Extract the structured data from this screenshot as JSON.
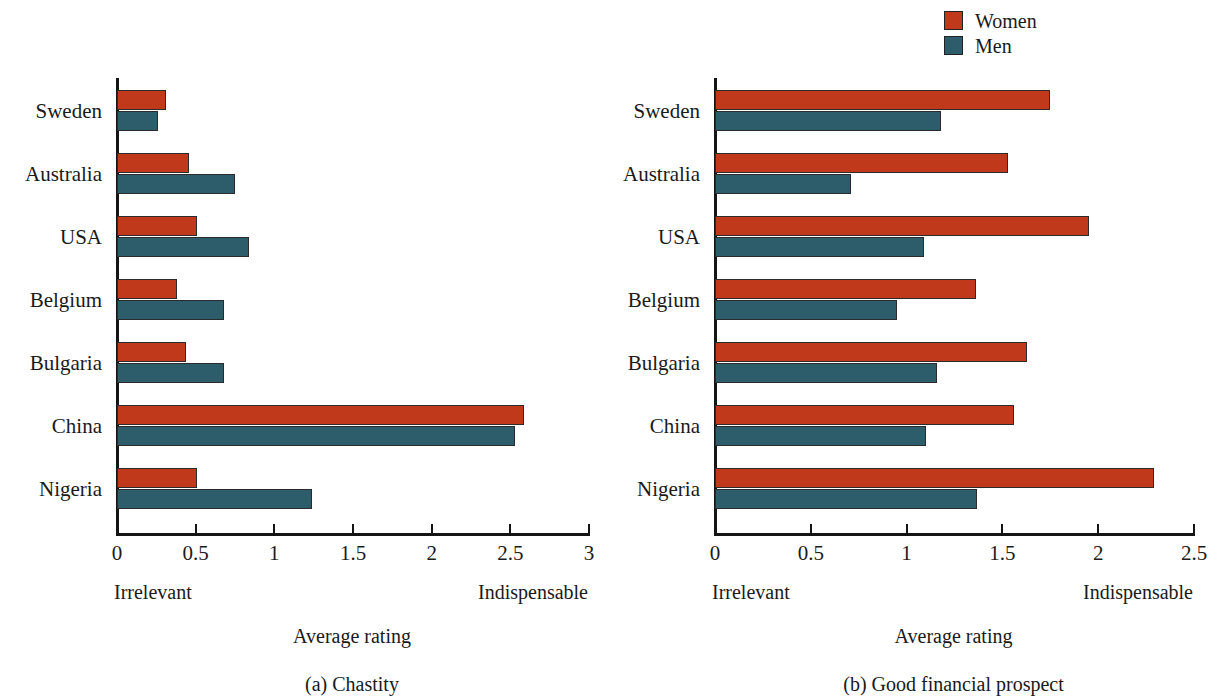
{
  "legend": {
    "items": [
      {
        "label": "Women",
        "color": "#c0391a",
        "icon": "legend-swatch-icon"
      },
      {
        "label": "Men",
        "color": "#2d5c6b",
        "icon": "legend-swatch-icon"
      }
    ]
  },
  "chart_data": [
    {
      "type": "bar",
      "orientation": "horizontal",
      "title": "(a) Chastity",
      "xlabel": "Average rating",
      "ylabel": "",
      "xlim": [
        0,
        3
      ],
      "xticks": [
        "0",
        "0.5",
        "1",
        "1.5",
        "2",
        "2.5",
        "3"
      ],
      "xtick_values": [
        0,
        0.5,
        1,
        1.5,
        2,
        2.5,
        3
      ],
      "grid": false,
      "legend_position": "top-right",
      "scale_low_label": "Irrelevant",
      "scale_high_label": "Indispensable",
      "categories": [
        "Sweden",
        "Australia",
        "USA",
        "Belgium",
        "Bulgaria",
        "China",
        "Nigeria"
      ],
      "series": [
        {
          "name": "Women",
          "color": "#c0391a",
          "values": [
            0.31,
            0.46,
            0.51,
            0.38,
            0.44,
            2.59,
            0.51
          ]
        },
        {
          "name": "Men",
          "color": "#2d5c6b",
          "values": [
            0.26,
            0.75,
            0.84,
            0.68,
            0.68,
            2.53,
            1.24
          ]
        }
      ]
    },
    {
      "type": "bar",
      "orientation": "horizontal",
      "title": "(b) Good financial prospect",
      "xlabel": "Average rating",
      "ylabel": "",
      "xlim": [
        0,
        2.5
      ],
      "xticks": [
        "0",
        "0.5",
        "1",
        "1.5",
        "2",
        "2.5"
      ],
      "xtick_values": [
        0,
        0.5,
        1,
        1.5,
        2,
        2.5
      ],
      "grid": false,
      "legend_position": "top-right",
      "scale_low_label": "Irrelevant",
      "scale_high_label": "Indispensable",
      "categories": [
        "Sweden",
        "Australia",
        "USA",
        "Belgium",
        "Bulgaria",
        "China",
        "Nigeria"
      ],
      "series": [
        {
          "name": "Women",
          "color": "#c0391a",
          "values": [
            1.75,
            1.53,
            1.95,
            1.36,
            1.63,
            1.56,
            2.29
          ]
        },
        {
          "name": "Men",
          "color": "#2d5c6b",
          "values": [
            1.18,
            0.71,
            1.09,
            0.95,
            1.16,
            1.1,
            1.37
          ]
        }
      ]
    }
  ]
}
